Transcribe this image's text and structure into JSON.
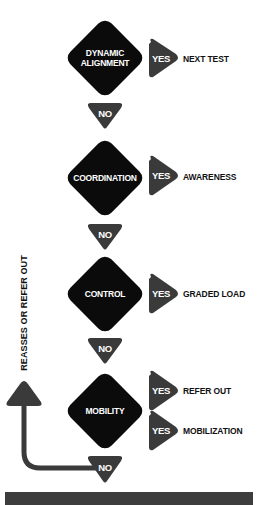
{
  "colors": {
    "diamond": "#0b0b0b",
    "triangle": "#3a3a3a",
    "text_dark": "#111111",
    "text_light": "#ffffff",
    "footer_bar": "#3d3d3d"
  },
  "flow": {
    "steps": [
      {
        "question": "DYNAMIC\nALIGNMENT",
        "yes_label": "YES",
        "yes_outcome": "NEXT TEST",
        "no_label": "NO"
      },
      {
        "question": "COORDINATION",
        "yes_label": "YES",
        "yes_outcome": "AWARENESS",
        "no_label": "NO"
      },
      {
        "question": "CONTROL",
        "yes_label": "YES",
        "yes_outcome": "GRADED LOAD",
        "no_label": "NO"
      },
      {
        "question": "MOBILITY",
        "yes_outcomes": [
          {
            "yes_label": "YES",
            "outcome": "REFER OUT"
          },
          {
            "yes_label": "YES",
            "outcome": "MOBILIZATION"
          }
        ],
        "no_label": "NO"
      }
    ],
    "loop_back_label": "REASSES OR REFER OUT"
  }
}
